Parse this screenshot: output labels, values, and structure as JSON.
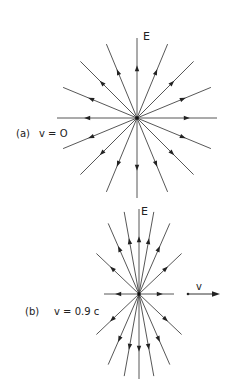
{
  "figure": {
    "panels": [
      {
        "id": "a",
        "label": "(a)",
        "velocity_label": "v = O",
        "field_label": "E",
        "description": "Isotropic radial electric field of a stationary charge",
        "line_count": 16,
        "line_angles_deg": [
          0,
          22.5,
          45,
          67.5,
          90,
          112.5,
          135,
          157.5,
          180,
          202.5,
          225,
          247.5,
          270,
          292.5,
          315,
          337.5
        ],
        "arrow_direction": "outward"
      },
      {
        "id": "b",
        "label": "(b)",
        "velocity_label": "v = 0.9 c",
        "field_label": "E",
        "velocity_arrow_label": "v",
        "description": "Field lines of a charge moving at 0.9c, compressed toward the transverse plane",
        "line_count": 16,
        "speed_fraction_c": 0.9,
        "arrow_direction": "outward"
      }
    ],
    "colors": {
      "line": "#444444",
      "text": "#222222",
      "background": "#ffffff"
    }
  }
}
